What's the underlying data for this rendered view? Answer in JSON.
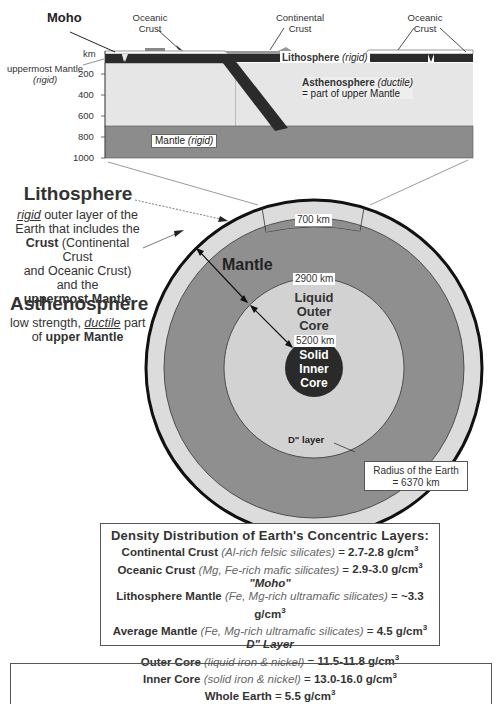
{
  "cross_section": {
    "labels": {
      "moho": "Moho",
      "oceanic_crust_left": "Oceanic\nCrust",
      "continental_crust": "Continental\nCrust",
      "oceanic_crust_right": "Oceanic\nCrust",
      "uppermost_mantle": "uppermost Mantle",
      "uppermost_mantle_note": "(rigid)",
      "lithosphere": "Lithosphere",
      "lithosphere_note": "(rigid)",
      "asthenosphere": "Asthenosphere",
      "asthenosphere_note": "(ductile)",
      "asthenosphere_sub": "= part of upper Mantle",
      "mantle": "Mantle",
      "mantle_note": "(rigid)"
    },
    "axis": {
      "unit": "km",
      "ticks": [
        "200",
        "400",
        "600",
        "800",
        "1000"
      ]
    },
    "colors": {
      "lithosphere": "#2b2b2b",
      "asthenosphere": "#e6e6e6",
      "mantle": "#8c8c8c",
      "continental_crust": "#999999"
    }
  },
  "earth": {
    "lithosphere_title": "Lithosphere",
    "lithosphere_desc": {
      "l1_it": "rigid",
      "l1": " outer layer of the",
      "l2": "Earth that includes the",
      "l3_b": "Crust",
      "l3": " (Continental Crust",
      "l4": "and Oceanic Crust)",
      "l5": "and the",
      "l6_b": "uppermost Mantle"
    },
    "asthenosphere_title": "Asthenosphere",
    "asthenosphere_desc": {
      "l1": "low strength, ",
      "l1_it": "ductile",
      "l1b": " part",
      "l2": "of ",
      "l2_b": "upper Mantle"
    },
    "mantle_label": "Mantle",
    "outer_core_label": "Liquid\nOuter\nCore",
    "inner_core_label": "Solid\nInner\nCore",
    "d_layer_label": "D\" layer",
    "depth_tags": {
      "d700": "700 km",
      "d2900": "2900 km",
      "d5200": "5200 km"
    },
    "radius_box": {
      "line1": "Radius of the Earth",
      "line2": "= 6370 km"
    },
    "colors": {
      "crust_ring": "#dcdcdc",
      "mantle": "#8f8f8f",
      "outer_core": "#d2d2d2",
      "inner_core": "#2a2a2a",
      "outline": "#111111"
    }
  },
  "density_table": {
    "title": "Density Distribution of Earth's Concentric Layers:",
    "rows": [
      {
        "name": "Continental Crust",
        "note": "(Al-rich felsic silicates)",
        "value": "2.7-2.8 g/cm"
      },
      {
        "name": "Oceanic Crust",
        "note": "(Mg, Fe-rich mafic silicates)",
        "value": "2.9-3.0 g/cm"
      },
      {
        "divider": "\"Moho\""
      },
      {
        "name": "Lithosphere Mantle",
        "note": "(Fe, Mg-rich ultramafic silicates)",
        "value": "~3.3 g/cm"
      },
      {
        "name": "Average Mantle",
        "note": "(Fe, Mg-rich ultramafic silicates)",
        "value": "4.5 g/cm"
      },
      {
        "divider": "D\" Layer"
      },
      {
        "name": "Outer Core",
        "note": "(liquid iron & nickel)",
        "value": "11.5-11.8 g/cm"
      },
      {
        "name": "Inner Core",
        "note": "(solid iron & nickel)",
        "value": "13.0-16.0 g/cm"
      },
      {
        "name": "Whole Earth",
        "note": "",
        "value": "5.5 g/cm"
      }
    ],
    "superscript": "3",
    "equals": " = "
  }
}
